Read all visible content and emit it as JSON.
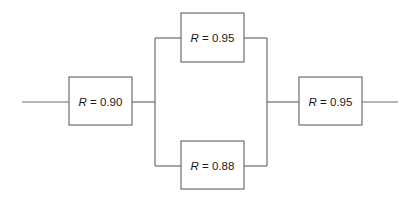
{
  "diagram": {
    "type": "reliability-block-diagram",
    "blocks": [
      {
        "id": "A",
        "variable": "R",
        "equals": " = ",
        "value": "0.90",
        "position": "series-left"
      },
      {
        "id": "B",
        "variable": "R",
        "equals": " = ",
        "value": "0.95",
        "position": "parallel-top"
      },
      {
        "id": "C",
        "variable": "R",
        "equals": " = ",
        "value": "0.88",
        "position": "parallel-bottom"
      },
      {
        "id": "D",
        "variable": "R",
        "equals": " = ",
        "value": "0.95",
        "position": "series-right"
      }
    ],
    "connections": [
      {
        "from": "input",
        "to": "A"
      },
      {
        "from": "A",
        "to": "B"
      },
      {
        "from": "A",
        "to": "C"
      },
      {
        "from": "B",
        "to": "D"
      },
      {
        "from": "C",
        "to": "D"
      },
      {
        "from": "D",
        "to": "output"
      }
    ],
    "colors": {
      "line": "#6e6e6e",
      "text": "#1a1a1a",
      "background": "#ffffff"
    }
  }
}
